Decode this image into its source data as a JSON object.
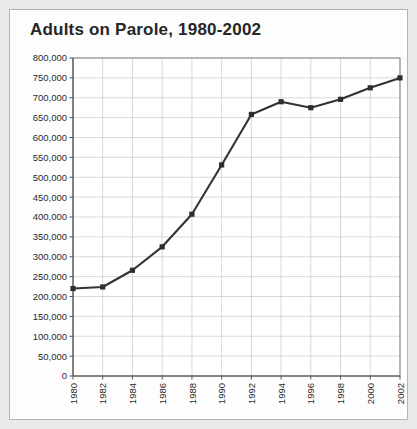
{
  "figure": {
    "title": "Adults on Parole, 1980-2002",
    "background_color": "#fdfdfd",
    "border_color": "#b4b4b4",
    "page_background": "#e9e9e9"
  },
  "chart_data": {
    "type": "line",
    "title": "Adults on Parole, 1980-2002",
    "xlabel": "",
    "ylabel": "",
    "x": [
      1980,
      1982,
      1984,
      1986,
      1988,
      1990,
      1992,
      1994,
      1996,
      1998,
      2000,
      2002
    ],
    "categories": [
      "1980",
      "1982",
      "1984",
      "1986",
      "1988",
      "1990",
      "1992",
      "1994",
      "1996",
      "1998",
      "2000",
      "2002"
    ],
    "values": [
      220000,
      224000,
      266000,
      325000,
      407000,
      531000,
      658000,
      690000,
      675000,
      696000,
      725000,
      750000
    ],
    "series": [
      {
        "name": "Adults on Parole",
        "values": [
          220000,
          224000,
          266000,
          325000,
          407000,
          531000,
          658000,
          690000,
          675000,
          696000,
          725000,
          750000
        ],
        "color": "#333333",
        "marker": "square"
      }
    ],
    "ylim": [
      0,
      800000
    ],
    "xlim": [
      1980,
      2002
    ],
    "ytick_labels": [
      "800,000",
      "750,000",
      "700,000",
      "650,000",
      "600,000",
      "550,000",
      "500,000",
      "450,000",
      "400,000",
      "350,000",
      "300,000",
      "250,000",
      "200,000",
      "150,000",
      "100,000",
      "50,000",
      "0"
    ],
    "ytick_values": [
      800000,
      750000,
      700000,
      650000,
      600000,
      550000,
      500000,
      450000,
      400000,
      350000,
      300000,
      250000,
      200000,
      150000,
      100000,
      50000,
      0
    ],
    "xtick_labels": [
      "1980",
      "1982",
      "1984",
      "1986",
      "1988",
      "1990",
      "1992",
      "1994",
      "1996",
      "1998",
      "2000",
      "2002"
    ],
    "grid": true,
    "grid_color": "#c9c9c9",
    "legend": false,
    "legend_position": "none",
    "xtick_rotation": -90
  }
}
